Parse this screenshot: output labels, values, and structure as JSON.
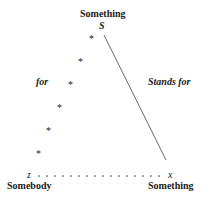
{
  "diagram": {
    "top_label": "Something",
    "top_symbol": "S",
    "left_edge_label": "for",
    "right_edge_label": "Stands for",
    "bottom_left_symbol": "z",
    "bottom_right_symbol": "x",
    "bottom_left_label": "Somebody",
    "bottom_right_label": "Something",
    "asterisk": "*"
  }
}
